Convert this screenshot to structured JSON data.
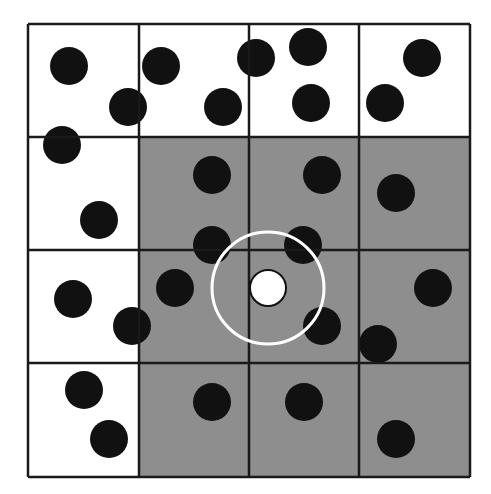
{
  "diagram": {
    "type": "grid-neighborhood",
    "grid": {
      "rows": 4,
      "cols": 4,
      "x_lines": [
        28,
        139,
        249,
        359,
        470
      ],
      "y_lines": [
        24,
        137,
        250,
        363,
        477
      ],
      "line_color": "#1a1a1a",
      "background": "#ffffff"
    },
    "shaded_cells": [
      [
        1,
        1
      ],
      [
        1,
        2
      ],
      [
        1,
        3
      ],
      [
        2,
        1
      ],
      [
        2,
        2
      ],
      [
        2,
        3
      ],
      [
        3,
        1
      ],
      [
        3,
        2
      ],
      [
        3,
        3
      ]
    ],
    "shade_color": "#8e8e8e",
    "points": {
      "radius": 19,
      "color": "#111111",
      "items": [
        [
          69,
          66
        ],
        [
          128,
          107
        ],
        [
          161,
          66
        ],
        [
          223,
          107
        ],
        [
          256,
          58
        ],
        [
          308,
          47
        ],
        [
          311,
          103
        ],
        [
          422,
          58
        ],
        [
          385,
          103
        ],
        [
          62,
          145
        ],
        [
          99,
          220
        ],
        [
          212,
          175
        ],
        [
          322,
          175
        ],
        [
          396,
          193
        ],
        [
          212,
          245
        ],
        [
          303,
          245
        ],
        [
          73,
          299
        ],
        [
          132,
          326
        ],
        [
          175,
          288
        ],
        [
          322,
          326
        ],
        [
          433,
          288
        ],
        [
          378,
          344
        ],
        [
          84,
          390
        ],
        [
          109,
          439
        ],
        [
          212,
          402
        ],
        [
          304,
          402
        ],
        [
          396,
          439
        ]
      ]
    },
    "query_point": {
      "cx": 268,
      "cy": 288,
      "r": 18,
      "fill": "#ffffff",
      "stroke": "#111111"
    },
    "search_radius": {
      "cx": 268,
      "cy": 288,
      "r": 56,
      "stroke": "#ffffff",
      "stroke_width": 3
    }
  }
}
